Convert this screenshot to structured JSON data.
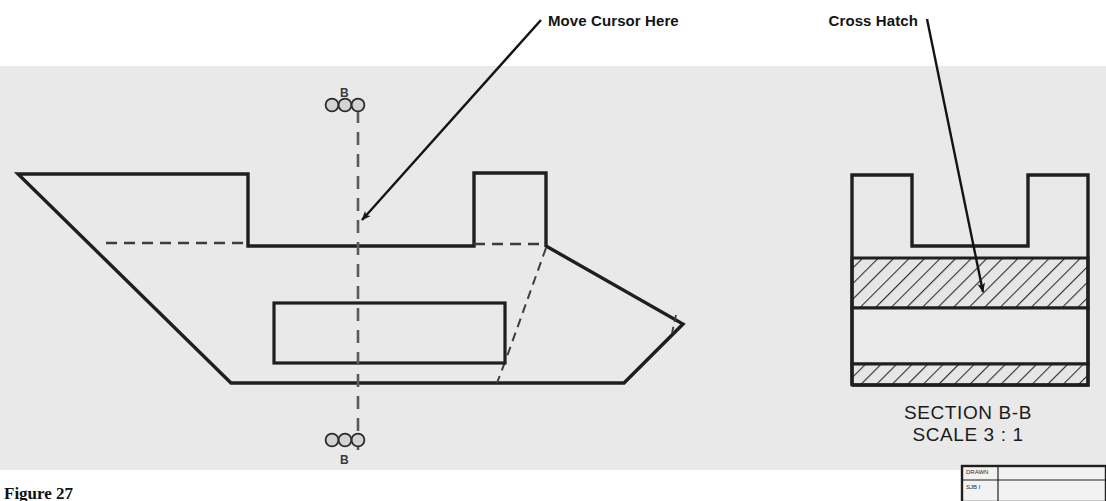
{
  "figure": {
    "caption": "Figure 27",
    "canvas_bg": "#ffffff",
    "drawing_area_bg": "#eaeaea"
  },
  "annotations": [
    {
      "id": "move-cursor-here",
      "label": "Move Cursor Here",
      "text_x": 548,
      "text_y": 26,
      "leader_from_x": 541,
      "leader_from_y": 20,
      "leader_to_x": 360,
      "leader_to_y": 222
    },
    {
      "id": "cross-hatch",
      "label": "Cross Hatch",
      "text_x": 816,
      "text_y": 26,
      "leader_from_x": 927,
      "leader_from_y": 19,
      "leader_to_x": 984,
      "leader_to_y": 296
    }
  ],
  "main_view": {
    "name": "front-view",
    "outline_points": "18,174 248,174 248,246 474,246 474,173 546,173 546,246 683,324 624,383 231,383 18,174",
    "hidden_lines": [
      "106,243 248,243",
      "474,244 546,244",
      "546,246 505,363",
      "505,363 498,383"
    ],
    "inner_rect": {
      "x": 274,
      "y": 303,
      "width": 231,
      "height": 60
    },
    "nose_detail": "672,318 683,324 674,331"
  },
  "section_line": {
    "name": "section-line-b-b",
    "x": 358,
    "top_y": 110,
    "bottom_y": 450,
    "letter": "B",
    "top_letter_x": 340,
    "top_letter_y": 95,
    "bottom_letter_x": 340,
    "bottom_letter_y": 463,
    "grip_color": "#8a8a8a",
    "grips_top_y": 105,
    "grips_bottom_y": 440,
    "grip_offsets": [
      -26,
      -13,
      0
    ]
  },
  "section_view": {
    "title_line1": "SECTION B-B",
    "title_line2": "SCALE 3 : 1",
    "title_x": 968,
    "title_line1_y": 419,
    "title_line2_y": 440,
    "outline_points": "852,175 852,385 1088,385 1088,175 1028,175 1028,246 912,246 912,175 852,175",
    "bands": [
      {
        "name": "upper-hatch-band",
        "x": 852,
        "y": 258,
        "width": 236,
        "height": 50,
        "hatched": true
      },
      {
        "name": "middle-plain-band",
        "x": 852,
        "y": 308,
        "width": 236,
        "height": 56,
        "hatched": false
      },
      {
        "name": "lower-hatch-band",
        "x": 852,
        "y": 364,
        "width": 236,
        "height": 21,
        "hatched": true
      }
    ]
  },
  "title_block": {
    "name": "title-block-fragment",
    "x": 962,
    "y": 466,
    "width": 144,
    "height": 35,
    "row1": "DRAWN",
    "row2": "SJB I"
  },
  "colors": {
    "line": "#1f1f1f",
    "hidden_line": "#3d3d3d",
    "centerline": "#5a5a5a",
    "hatch": "#333333",
    "text": "#141414"
  }
}
